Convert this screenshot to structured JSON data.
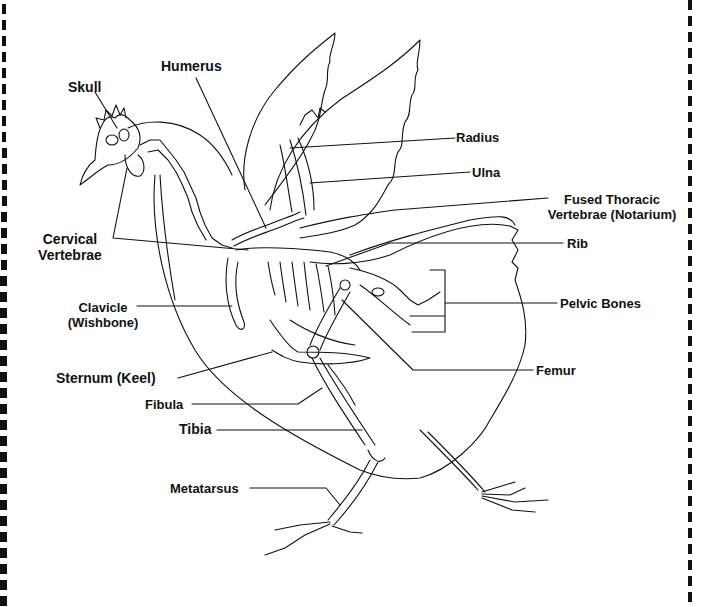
{
  "diagram": {
    "labels": {
      "skull": "Skull",
      "humerus": "Humerus",
      "radius": "Radius",
      "ulna": "Ulna",
      "fused_thoracic_1": "Fused Thoracic",
      "fused_thoracic_2": "Vertebrae (Notarium)",
      "rib": "Rib",
      "cervical_1": "Cervical",
      "cervical_2": "Vertebrae",
      "clavicle_1": "Clavicle",
      "clavicle_2": "(Wishbone)",
      "pelvic": "Pelvic Bones",
      "sternum": "Sternum (Keel)",
      "femur": "Femur",
      "fibula": "Fibula",
      "tibia": "Tibia",
      "metatarsus": "Metatarsus"
    },
    "colors": {
      "line": "#111111",
      "background": "#ffffff"
    }
  }
}
